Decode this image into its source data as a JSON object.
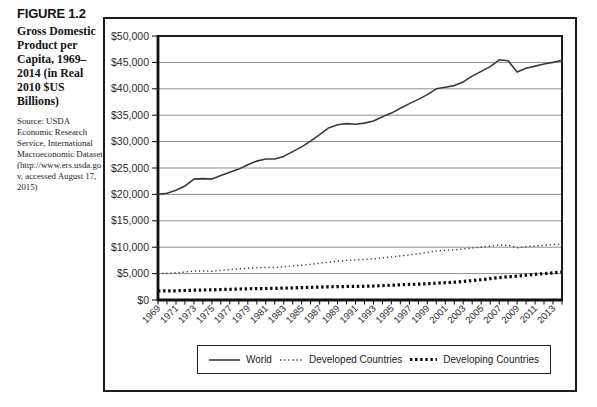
{
  "figure": {
    "label": "FIGURE 1.2",
    "title": "Gross Domestic Product per Capita, 1969–2014 (in Real 2010 $US Billions)",
    "source": "Source: USDA Economic Research Service, International Macroeconomic Dataset (http://www.ers.usda.gov, accessed August 17, 2015)"
  },
  "chart_data": {
    "type": "line",
    "title": "",
    "xlabel": "",
    "ylabel": "",
    "x_start": 1969,
    "x_end": 2014,
    "x_tick_labels": [
      1969,
      1971,
      1973,
      1975,
      1977,
      1979,
      1981,
      1983,
      1985,
      1987,
      1989,
      1991,
      1993,
      1995,
      1997,
      1999,
      2001,
      2003,
      2005,
      2007,
      2009,
      2011,
      2013
    ],
    "ylim": [
      0,
      50000
    ],
    "grid": true,
    "legend_position": "bottom",
    "y_ticks": [
      {
        "value": 0,
        "label": "$0"
      },
      {
        "value": 5000,
        "label": "$5,000"
      },
      {
        "value": 10000,
        "label": "$10,000"
      },
      {
        "value": 15000,
        "label": "$15,000"
      },
      {
        "value": 20000,
        "label": "$20,000"
      },
      {
        "value": 25000,
        "label": "$25,000"
      },
      {
        "value": 30000,
        "label": "$30,000"
      },
      {
        "value": 35000,
        "label": "$35,000"
      },
      {
        "value": 40000,
        "label": "$40,000"
      },
      {
        "value": 45000,
        "label": "$45,000"
      },
      {
        "value": 50000,
        "label": "$50,000"
      }
    ],
    "series": [
      {
        "name": "World",
        "style": "solid",
        "values": [
          20000,
          20200,
          20800,
          21600,
          22900,
          23000,
          22900,
          23600,
          24200,
          24800,
          25600,
          26300,
          26700,
          26700,
          27200,
          28100,
          29000,
          30100,
          31300,
          32600,
          33200,
          33400,
          33300,
          33500,
          33900,
          34700,
          35400,
          36300,
          37200,
          38000,
          38900,
          40000,
          40300,
          40600,
          41300,
          42400,
          43300,
          44200,
          45500,
          45300,
          43200,
          43900,
          44300,
          44700,
          45000,
          45400
        ]
      },
      {
        "name": "Developed Countries",
        "style": "dotted",
        "values": [
          5000,
          5050,
          5150,
          5300,
          5500,
          5500,
          5450,
          5600,
          5750,
          5900,
          6000,
          6100,
          6150,
          6150,
          6300,
          6450,
          6600,
          6750,
          6950,
          7150,
          7350,
          7500,
          7600,
          7700,
          7800,
          7950,
          8150,
          8350,
          8550,
          8750,
          9000,
          9300,
          9400,
          9500,
          9650,
          9850,
          10000,
          10200,
          10400,
          10350,
          9900,
          10100,
          10250,
          10350,
          10500,
          10600
        ]
      },
      {
        "name": "Developing Countries",
        "style": "bold-dotted",
        "values": [
          1700,
          1720,
          1750,
          1800,
          1850,
          1900,
          1920,
          1980,
          2030,
          2080,
          2130,
          2160,
          2180,
          2200,
          2250,
          2300,
          2350,
          2400,
          2450,
          2500,
          2530,
          2550,
          2570,
          2600,
          2650,
          2720,
          2800,
          2880,
          2950,
          3000,
          3080,
          3200,
          3280,
          3380,
          3520,
          3700,
          3850,
          4050,
          4250,
          4400,
          4500,
          4700,
          4850,
          5000,
          5150,
          5300
        ]
      }
    ]
  }
}
